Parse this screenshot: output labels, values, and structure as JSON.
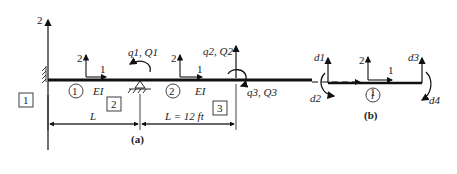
{
  "figure_a": {
    "caption": "(a)",
    "global_axes": {
      "vertical": "2",
      "horizontal": "1"
    },
    "local_axes_elem1": {
      "vertical": "2",
      "horizontal": "1"
    },
    "local_axes_elem2": {
      "vertical": "2",
      "horizontal": "1"
    },
    "elements": [
      {
        "id": "1",
        "stiffness": "EI"
      },
      {
        "id": "2",
        "stiffness": "EI"
      }
    ],
    "nodes": [
      "1",
      "2",
      "3"
    ],
    "dofs": {
      "q1": "q1, Q1",
      "q2": "q2, Q2",
      "q3": "q3, Q3"
    },
    "dimensions": {
      "span1": "L",
      "span2": "L = 12 ft"
    }
  },
  "figure_b": {
    "caption": "(b)",
    "element_label": "i",
    "local_axes": {
      "vertical": "2",
      "horizontal": "1"
    },
    "dofs": [
      "d1",
      "d2",
      "d3",
      "d4"
    ]
  }
}
